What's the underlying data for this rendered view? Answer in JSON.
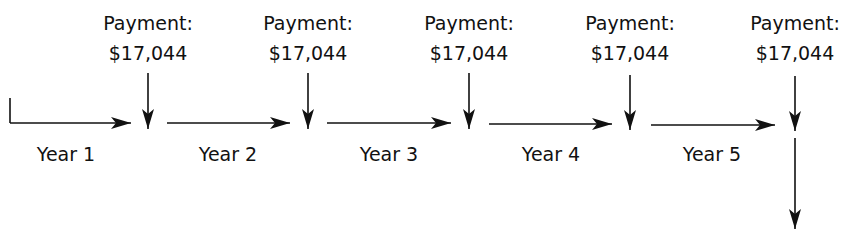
{
  "diagram": {
    "type": "cash-flow timeline",
    "payments": [
      {
        "label": "Payment:",
        "amount": "$17,044"
      },
      {
        "label": "Payment:",
        "amount": "$17,044"
      },
      {
        "label": "Payment:",
        "amount": "$17,044"
      },
      {
        "label": "Payment:",
        "amount": "$17,044"
      },
      {
        "label": "Payment:",
        "amount": "$17,044"
      }
    ],
    "periods": [
      {
        "label": "Year 1"
      },
      {
        "label": "Year 2"
      },
      {
        "label": "Year 3"
      },
      {
        "label": "Year 4"
      },
      {
        "label": "Year 5"
      }
    ],
    "colors": {
      "line": "#111111",
      "background": "#ffffff"
    }
  }
}
